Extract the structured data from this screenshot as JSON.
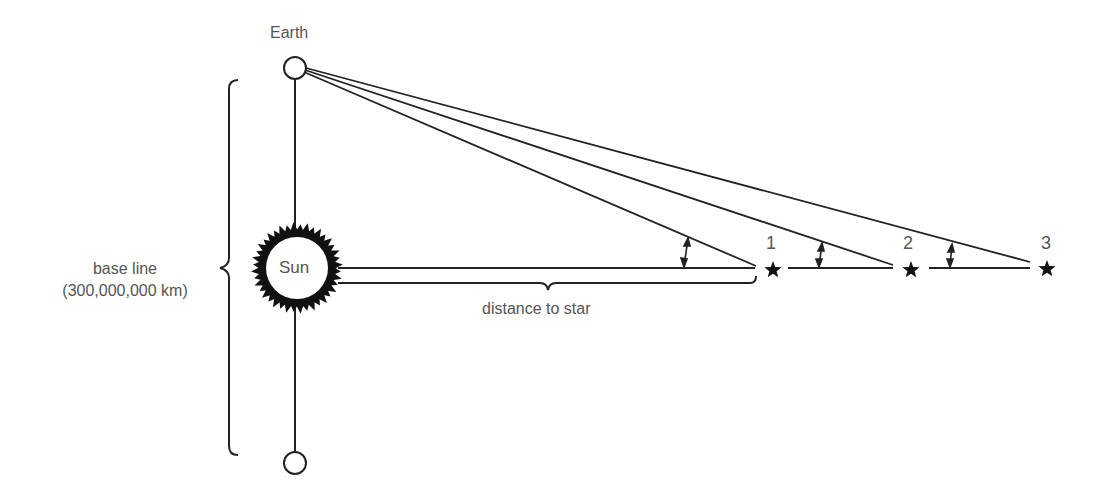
{
  "diagram": {
    "labels": {
      "earth": "Earth",
      "sun": "Sun",
      "baseline_line1": "base line",
      "baseline_line2": "(300,000,000 km)",
      "distance": "distance to star"
    },
    "stars": [
      {
        "label": "1",
        "icon": "star-icon"
      },
      {
        "label": "2",
        "icon": "star-icon"
      },
      {
        "label": "3",
        "icon": "star-icon"
      }
    ],
    "colors": {
      "line": "#222222",
      "text": "#555555",
      "background": "#ffffff"
    }
  }
}
